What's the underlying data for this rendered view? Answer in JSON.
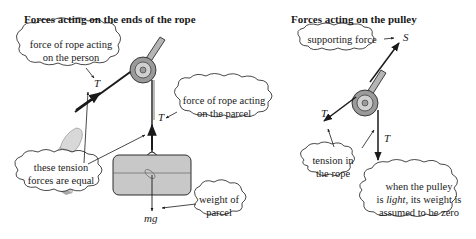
{
  "left_panel": {
    "title": "Forces acting on the ends of the rope",
    "callouts": {
      "person_force": [
        "force of rope acting",
        "on the person"
      ],
      "parcel_force": [
        "force of rope acting",
        "on the parcel"
      ],
      "equal_tension": [
        "these tension",
        "forces are equal"
      ],
      "weight": [
        "weight of",
        "parcel"
      ]
    },
    "symbols": {
      "tension_person": "T",
      "tension_parcel": "T",
      "weight": "mg"
    }
  },
  "right_panel": {
    "title": "Forces acting on the pulley",
    "callouts": {
      "support": "supporting force",
      "tension": [
        "tension in",
        "the rope"
      ],
      "light_pre": "when the pulley",
      "light_mid_a": "is ",
      "light_italic": "light",
      "light_mid_b": ", its weight is",
      "light_post": "assumed to be zero"
    },
    "symbols": {
      "support": "S",
      "tension_left": "T",
      "tension_down": "T"
    }
  },
  "colors": {
    "line": "#1a1a1a",
    "pulley_outer": "#9a9a9a",
    "pulley_inner": "#d0d0d0",
    "parcel_fill": "#c8c8c8",
    "glove_fill": "#cfcfcf",
    "rod_fill": "#b5b5b5"
  }
}
